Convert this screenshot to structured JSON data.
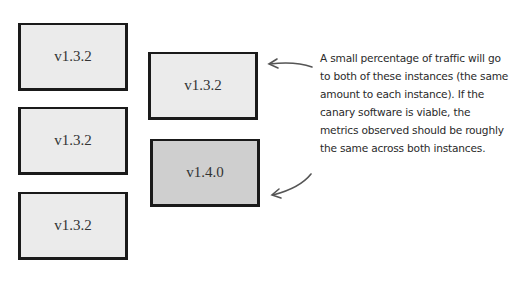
{
  "diagram": {
    "boxes": [
      {
        "id": "left-1",
        "label": "v1.3.2",
        "version_type": "current"
      },
      {
        "id": "left-2",
        "label": "v1.3.2",
        "version_type": "current"
      },
      {
        "id": "left-3",
        "label": "v1.3.2",
        "version_type": "current"
      },
      {
        "id": "right-1",
        "label": "v1.3.2",
        "version_type": "current"
      },
      {
        "id": "right-2",
        "label": "v1.4.0",
        "version_type": "canary"
      }
    ],
    "annotation": "A small percentage of traffic will go to both of these instances (the same amount to each instance). If the canary software is viable, the metrics observed should be roughly the same across both instances.",
    "colors": {
      "box_fill_current": "#ebebeb",
      "box_fill_canary": "#cfcfcf",
      "stroke": "#1a1a1a"
    }
  }
}
